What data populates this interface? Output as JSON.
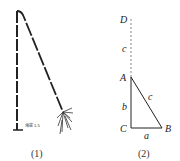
{
  "figure1": {
    "caption": "(1)",
    "annotation": "海拔 1.5"
  },
  "figure2": {
    "caption": "(2)",
    "points": {
      "D": "D",
      "A": "A",
      "B": "B",
      "C": "C"
    },
    "sides": {
      "a": "a",
      "b": "b",
      "c_hyp": "c",
      "c_ext": "c"
    }
  }
}
